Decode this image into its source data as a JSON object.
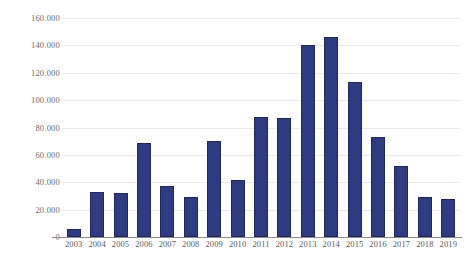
{
  "chart_data": {
    "type": "bar",
    "title": "",
    "subtitle": "",
    "xlabel": "",
    "ylabel": "",
    "categories": [
      "2003",
      "2004",
      "2005",
      "2006",
      "2007",
      "2008",
      "2009",
      "2010",
      "2011",
      "2012",
      "2013",
      "2014",
      "2015",
      "2016",
      "2017",
      "2018",
      "2019"
    ],
    "values": [
      6000,
      33000,
      32000,
      69000,
      37000,
      29000,
      70000,
      42000,
      88000,
      87000,
      140000,
      146000,
      113000,
      73000,
      52000,
      29000,
      28000
    ],
    "series": [
      {
        "name": "",
        "values": [
          6000,
          33000,
          32000,
          69000,
          37000,
          29000,
          70000,
          42000,
          88000,
          87000,
          140000,
          146000,
          113000,
          73000,
          52000,
          29000,
          28000
        ]
      }
    ],
    "ylim": [
      0,
      160000
    ],
    "yticks": [
      0,
      20000,
      40000,
      60000,
      80000,
      100000,
      120000,
      140000,
      160000
    ],
    "ytick_labels": [
      "0",
      "20.000",
      "40.000",
      "60.000",
      "80.000",
      "100.000",
      "120.000",
      "140.000",
      "160.000"
    ],
    "xtick_labels": [
      "2003",
      "2004",
      "2005",
      "2006",
      "2007",
      "2008",
      "2009",
      "2010",
      "2011",
      "2012",
      "2013",
      "2014",
      "2015",
      "2016",
      "2017",
      "2018",
      "2019"
    ],
    "grid": true,
    "grid_axis": "y",
    "legend": false,
    "legend_position": "none",
    "annotations": [],
    "colors": {
      "bar_fill": "#2e3b80",
      "bar_stroke": "#20295c",
      "gridline": "#e9e9ef",
      "axis_line": "#8c8c8c",
      "ytick_text": "#6b6b6b",
      "xtick_text": "#5a5a5a",
      "background": "#ffffff"
    }
  }
}
